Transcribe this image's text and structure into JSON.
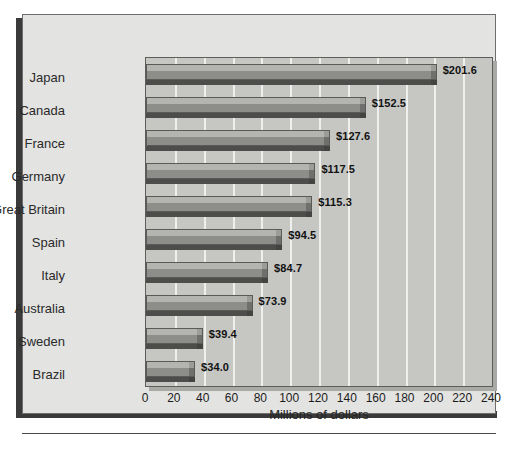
{
  "chart_data": {
    "type": "bar",
    "orientation": "horizontal",
    "title": "",
    "xlabel": "Millions of dollars",
    "ylabel": "",
    "xlim": [
      0,
      240
    ],
    "xticks": [
      0,
      20,
      40,
      60,
      80,
      100,
      120,
      140,
      160,
      180,
      200,
      220,
      240
    ],
    "xtick_labels": [
      "0",
      "20",
      "40",
      "60",
      "80",
      "100",
      "120",
      "140",
      "160",
      "180",
      "200",
      "220",
      "240"
    ],
    "grid": "vertical",
    "legend": "none",
    "categories": [
      "Japan",
      "Canada",
      "France",
      "Germany",
      "Great Britain",
      "Spain",
      "Italy",
      "Australia",
      "Sweden",
      "Brazil"
    ],
    "values": [
      201.6,
      152.5,
      127.6,
      117.5,
      115.3,
      94.5,
      84.7,
      73.9,
      39.4,
      34.0
    ],
    "data_labels": [
      "$201.6",
      "$152.5",
      "$127.6",
      "$117.5",
      "$115.3",
      "$94.5",
      "$84.7",
      "$73.9",
      "$39.4",
      "$34.0"
    ],
    "bars": [
      {
        "category": "Japan",
        "value": 201.6,
        "label": "$201.6"
      },
      {
        "category": "Canada",
        "value": 152.5,
        "label": "$152.5"
      },
      {
        "category": "France",
        "value": 127.6,
        "label": "$127.6"
      },
      {
        "category": "Germany",
        "value": 117.5,
        "label": "$117.5"
      },
      {
        "category": "Great Britain",
        "value": 115.3,
        "label": "$115.3"
      },
      {
        "category": "Spain",
        "value": 94.5,
        "label": "$94.5"
      },
      {
        "category": "Italy",
        "value": 84.7,
        "label": "$84.7"
      },
      {
        "category": "Australia",
        "value": 73.9,
        "label": "$73.9"
      },
      {
        "category": "Sweden",
        "value": 39.4,
        "label": "$39.4"
      },
      {
        "category": "Brazil",
        "value": 34.0,
        "label": "$34.0"
      }
    ]
  },
  "colors": {
    "page_background": "#ffffff",
    "frame_background": "#e3e3e1",
    "frame_shadow": "#3a3a3a",
    "plot_background": "#c6c6c3",
    "plot_border": "#5d5d5d",
    "plot_shadow": "#a9a9a6",
    "gridline": "#efefee",
    "bar_top_face": "#b4b4b1",
    "bar_main_face": "#8d8d8a",
    "bar_base_shadow": "#4d4d4b",
    "label_text": "#121212",
    "category_text": "#2a2a2a"
  }
}
